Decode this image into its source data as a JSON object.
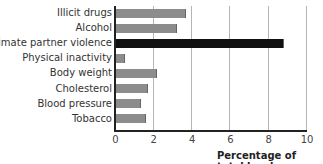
{
  "chart_data": {
    "type": "bar",
    "orientation": "horizontal",
    "title": "",
    "xlabel": "Percentage of total burden",
    "ylabel": "",
    "xlim": [
      0,
      10
    ],
    "xticks": [
      "0",
      "2",
      "4",
      "6",
      "8",
      "10"
    ],
    "grid": "vertical",
    "categories": [
      "Illicit drugs",
      "Alcohol",
      "Intimate partner violence",
      "Physical inactivity",
      "Body weight",
      "Cholesterol",
      "Blood pressure",
      "Tobacco"
    ],
    "values": [
      3.7,
      3.25,
      8.8,
      0.5,
      2.2,
      1.7,
      1.35,
      1.6
    ],
    "highlight": "Intimate partner violence",
    "colors": {
      "bar": "#8c8c8c",
      "highlight": "#111111"
    }
  }
}
